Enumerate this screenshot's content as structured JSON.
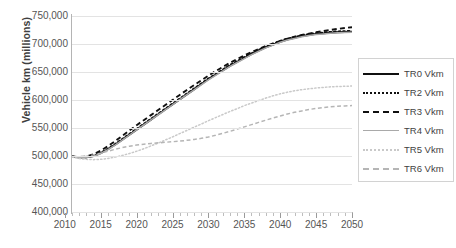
{
  "chart_data": {
    "type": "line",
    "title": "",
    "xlabel": "",
    "ylabel": "Vehicle km (millions)",
    "xlim": [
      2011,
      2050
    ],
    "ylim": [
      400000,
      750000
    ],
    "grid": true,
    "legend_position": "right",
    "x_ticks": [
      "2010",
      "2015",
      "2020",
      "2025",
      "2030",
      "2035",
      "2040",
      "2045",
      "2050"
    ],
    "y_ticks": [
      "400,000",
      "450,000",
      "500,000",
      "550,000",
      "600,000",
      "650,000",
      "700,000",
      "750,000"
    ],
    "x": [
      2011,
      2012,
      2013,
      2014,
      2015,
      2016,
      2017,
      2018,
      2019,
      2020,
      2021,
      2022,
      2023,
      2024,
      2025,
      2026,
      2027,
      2028,
      2029,
      2030,
      2031,
      2032,
      2033,
      2034,
      2035,
      2036,
      2037,
      2038,
      2039,
      2040,
      2041,
      2042,
      2043,
      2044,
      2045,
      2046,
      2047,
      2048,
      2049,
      2050
    ],
    "series": [
      {
        "name": "TR0 Vkm",
        "style": "solid",
        "color": "#101010",
        "values": [
          499000,
          497500,
          497500,
          500000,
          505000,
          512000,
          520000,
          529000,
          538000,
          547000,
          556000,
          565000,
          574000,
          583000,
          592000,
          601000,
          610000,
          619000,
          628000,
          637000,
          645000,
          653000,
          661000,
          668000,
          675000,
          682000,
          688000,
          694000,
          699000,
          704000,
          708000,
          711000,
          714000,
          716000,
          718000,
          719000,
          720000,
          721000,
          721500,
          722000
        ]
      },
      {
        "name": "TR2 Vkm",
        "style": "dotted",
        "color": "#101010",
        "values": [
          499000,
          497500,
          497800,
          500500,
          505800,
          513000,
          521500,
          530500,
          539500,
          548500,
          557500,
          566500,
          575500,
          584500,
          593500,
          602500,
          611500,
          620500,
          629500,
          638500,
          646500,
          654500,
          662500,
          669500,
          676500,
          683500,
          689500,
          695500,
          700500,
          705500,
          709500,
          712500,
          715500,
          717500,
          719500,
          720500,
          721500,
          722500,
          723000,
          723500
        ]
      },
      {
        "name": "TR3 Vkm",
        "style": "dashed",
        "color": "#101010",
        "values": [
          499000,
          498000,
          499000,
          503000,
          509500,
          517500,
          526500,
          536000,
          545500,
          555000,
          564000,
          573000,
          582000,
          591000,
          600000,
          609000,
          618000,
          626500,
          635000,
          643500,
          651500,
          659000,
          666500,
          673000,
          679500,
          685500,
          691000,
          696500,
          701000,
          705500,
          709500,
          713000,
          716000,
          718500,
          721000,
          723000,
          725000,
          727000,
          728500,
          730000
        ]
      },
      {
        "name": "TR4 Vkm",
        "style": "solid",
        "color": "#a9a9a9",
        "values": [
          499000,
          497200,
          497200,
          499500,
          504500,
          511500,
          519500,
          528500,
          537500,
          546500,
          555500,
          564500,
          573500,
          582500,
          591500,
          600500,
          609500,
          618000,
          627000,
          636000,
          644000,
          652000,
          660000,
          667000,
          674000,
          681000,
          687000,
          693000,
          698000,
          703000,
          707000,
          710000,
          713000,
          715000,
          717000,
          718000,
          719000,
          720000,
          720500,
          721000
        ]
      },
      {
        "name": "TR5 Vkm",
        "style": "dotted",
        "color": "#c9c9c9",
        "values": [
          498000,
          495500,
          494000,
          493500,
          494000,
          495500,
          498000,
          501000,
          504500,
          508500,
          513000,
          518000,
          523000,
          528500,
          534000,
          540000,
          545500,
          551500,
          557000,
          563000,
          568500,
          574000,
          579500,
          584500,
          590000,
          594500,
          599000,
          603500,
          607500,
          611000,
          614000,
          616500,
          618500,
          620000,
          621500,
          622500,
          623500,
          624000,
          624500,
          625000
        ]
      },
      {
        "name": "TR6 Vkm",
        "style": "dashed",
        "color": "#b5b5b5",
        "values": [
          499000,
          498500,
          499500,
          502000,
          505000,
          508500,
          512000,
          515000,
          517500,
          519500,
          521000,
          522500,
          523500,
          524500,
          525500,
          526500,
          528000,
          529500,
          531500,
          534000,
          537000,
          540500,
          544000,
          548000,
          552000,
          556000,
          560000,
          564000,
          568000,
          571500,
          575000,
          578000,
          580500,
          583000,
          585000,
          586500,
          588000,
          589000,
          589500,
          590000
        ]
      }
    ]
  },
  "legend": {
    "items": [
      {
        "label": "TR0 Vkm",
        "swatch": "sw-solid-black"
      },
      {
        "label": "TR2 Vkm",
        "swatch": "sw-dot-black"
      },
      {
        "label": "TR3 Vkm",
        "swatch": "sw-dash-black"
      },
      {
        "label": "TR4 Vkm",
        "swatch": "sw-solid-gray"
      },
      {
        "label": "TR5 Vkm",
        "swatch": "sw-dot-gray"
      },
      {
        "label": "TR6 Vkm",
        "swatch": "sw-dash-gray"
      }
    ]
  }
}
